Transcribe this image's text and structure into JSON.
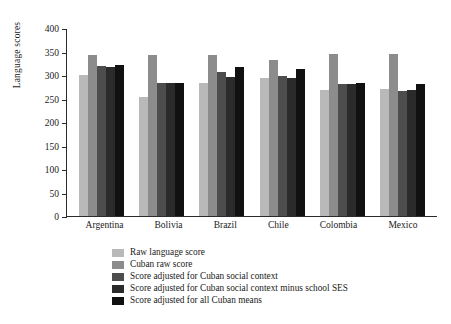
{
  "chart_data": {
    "type": "bar",
    "title": "",
    "xlabel": "",
    "ylabel": "Language scores",
    "ylim": [
      0,
      400
    ],
    "ytick_labels": [
      "400",
      "350",
      "300",
      "250",
      "200",
      "150",
      "100",
      "50",
      "0"
    ],
    "yticks": [
      400,
      350,
      300,
      250,
      200,
      150,
      100,
      50,
      0
    ],
    "grid": false,
    "legend_position": "bottom-left",
    "categories": [
      "Argentina",
      "Bolivia",
      "Brazil",
      "Chile",
      "Colombia",
      "Mexico"
    ],
    "series": [
      {
        "name": "Raw language score",
        "color": "#b9b9b9",
        "values": [
          301,
          253,
          283,
          293,
          269,
          271
        ]
      },
      {
        "name": "Cuban raw score",
        "color": "#8c8c8c",
        "values": [
          343,
          343,
          343,
          331,
          344,
          345
        ]
      },
      {
        "name": "Score adjusted for Cuban social context",
        "color": "#4d4d4d",
        "values": [
          319,
          282,
          307,
          297,
          281,
          266
        ]
      },
      {
        "name": "Score adjusted for Cuban social context minus school SES",
        "color": "#2b2b2b",
        "values": [
          317,
          282,
          296,
          294,
          281,
          269
        ]
      },
      {
        "name": "Score adjusted for all Cuban means",
        "color": "#111111",
        "values": [
          322,
          283,
          316,
          313,
          282,
          280
        ]
      }
    ]
  }
}
